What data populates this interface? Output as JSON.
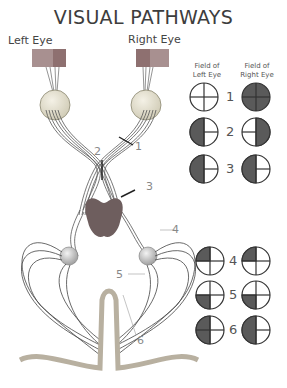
{
  "title": "VISUAL PATHWAYS",
  "eyes": {
    "left_label": "Left Eye",
    "right_label": "Right Eye"
  },
  "fields": {
    "left_header": [
      "Field of",
      "Left Eye"
    ],
    "right_header": [
      "Field of",
      "Right Eye"
    ],
    "rows": [
      {
        "number": "1",
        "left": "full-open",
        "right": "full-blind"
      },
      {
        "number": "2",
        "left": "left-half-blind",
        "right": "right-half-blind"
      },
      {
        "number": "3",
        "left": "left-half-blind",
        "right": "left-half-blind"
      },
      {
        "number": "4",
        "left": "upper-left-quadrant-blind",
        "right": "upper-left-quadrant-blind"
      },
      {
        "number": "5",
        "left": "lower-left-quadrant-blind",
        "right": "lower-left-quadrant-blind"
      },
      {
        "number": "6",
        "left": "left-half-blind",
        "right": "left-half-blind"
      }
    ]
  },
  "lesion_labels": {
    "l1": "1",
    "l2": "2",
    "l3": "3",
    "l4": "4",
    "l5": "5",
    "l6": "6"
  },
  "colors": {
    "blind": "#5a5a5a",
    "outline": "#333333",
    "stimulus_dark": "#8a6e6e",
    "stimulus_light": "#a08a8a"
  }
}
